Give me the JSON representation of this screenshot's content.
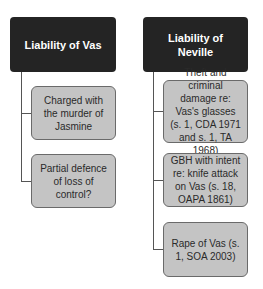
{
  "diagram": {
    "left": {
      "title": "Liability of Vas",
      "children": [
        {
          "label": "Charged with the murder of Jasmine"
        },
        {
          "label": "Partial defence of loss of control?"
        }
      ]
    },
    "right": {
      "title": "Liability of Neville",
      "children": [
        {
          "label": "Theft and criminal damage re: Vas's glasses (s. 1, CDA 1971 and s. 1, TA 1968)"
        },
        {
          "label": "GBH with intent re: knife attack on Vas (s. 18, OAPA 1861)"
        },
        {
          "label": "Rape of Vas (s. 1, SOA 2003)"
        }
      ]
    },
    "colors": {
      "header_bg": "#242424",
      "header_text": "#ffffff",
      "child_bg": "#c4c4c4",
      "child_border": "#6a6a6a",
      "connector": "#555555"
    }
  }
}
